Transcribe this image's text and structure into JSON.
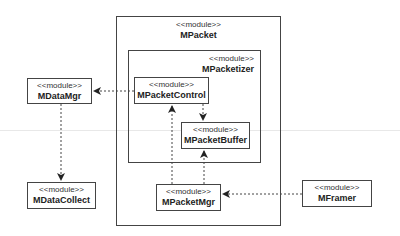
{
  "diagram": {
    "type": "UML module dependency diagram",
    "stereotype": "<<module>>",
    "modules": [
      {
        "id": "MPacket",
        "stereotype": "<<module>>",
        "name": "MPacket",
        "kind": "container"
      },
      {
        "id": "MPacketizer",
        "stereotype": "<<module>>",
        "name": "MPacketizer",
        "kind": "container",
        "parent": "MPacket"
      },
      {
        "id": "MPacketControl",
        "stereotype": "<<module>>",
        "name": "MPacketControl",
        "parent": "MPacketizer"
      },
      {
        "id": "MPacketBuffer",
        "stereotype": "<<module>>",
        "name": "MPacketBuffer",
        "parent": "MPacketizer"
      },
      {
        "id": "MPacketMgr",
        "stereotype": "<<module>>",
        "name": "MPacketMgr",
        "parent": "MPacket"
      },
      {
        "id": "MDataMgr",
        "stereotype": "<<module>>",
        "name": "MDataMgr"
      },
      {
        "id": "MDataCollect",
        "stereotype": "<<module>>",
        "name": "MDataCollect"
      },
      {
        "id": "MFramer",
        "stereotype": "<<module>>",
        "name": "MFramer"
      }
    ],
    "dependencies": [
      {
        "from": "MPacketControl",
        "to": "MDataMgr",
        "style": "dashed"
      },
      {
        "from": "MDataMgr",
        "to": "MDataCollect",
        "style": "dashed"
      },
      {
        "from": "MPacketControl",
        "to": "MPacketBuffer",
        "style": "dashed"
      },
      {
        "from": "MPacketMgr",
        "to": "MPacketControl",
        "style": "dashed"
      },
      {
        "from": "MPacketMgr",
        "to": "MPacketBuffer",
        "style": "dashed"
      },
      {
        "from": "MFramer",
        "to": "MPacketMgr",
        "style": "dashed"
      }
    ]
  },
  "labels": {
    "mpacket": {
      "stereo": "<<module>>",
      "name": "MPacket"
    },
    "mpacketizer": {
      "stereo": "<<module>>",
      "name": "MPacketizer"
    },
    "mpacketcontrol": {
      "stereo": "<<module>>",
      "name": "MPacketControl"
    },
    "mpacketbuffer": {
      "stereo": "<<module>>",
      "name": "MPacketBuffer"
    },
    "mpacketmgr": {
      "stereo": "<<module>>",
      "name": "MPacketMgr"
    },
    "mdatamgr": {
      "stereo": "<<module>>",
      "name": "MDataMgr"
    },
    "mdatacollect": {
      "stereo": "<<module>>",
      "name": "MDataCollect"
    },
    "mframer": {
      "stereo": "<<module>>",
      "name": "MFramer"
    }
  },
  "colors": {
    "line": "#444444",
    "background": "#ffffff",
    "text": "#222222"
  }
}
